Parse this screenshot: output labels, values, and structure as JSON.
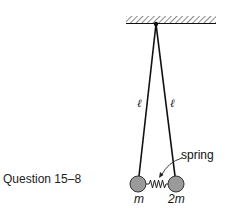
{
  "caption": "Question 15–8",
  "diagram": {
    "string_left_label": "ℓ",
    "string_right_label": "ℓ",
    "spring_label": "spring",
    "mass_left_label": "m",
    "mass_right_label": "2m",
    "colors": {
      "ball_fill": "#9a9a9a",
      "line": "#111111",
      "hatch": "#555555"
    }
  }
}
